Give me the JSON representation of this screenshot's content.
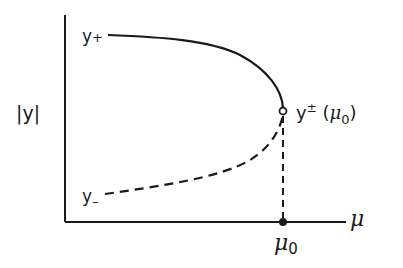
{
  "diagram": {
    "type": "bifurcation-diagram",
    "axes": {
      "y_label": "|y|",
      "x_label": "μ",
      "x_tick_label_symbol": "μ",
      "x_tick_label_subscript": "0"
    },
    "branches": {
      "upper": {
        "symbol": "y",
        "subscript": "+",
        "style": "solid"
      },
      "lower": {
        "symbol": "y",
        "subscript": "–",
        "style": "dashed"
      }
    },
    "turning_point": {
      "symbol": "y",
      "superscript": "±",
      "open_paren": "(",
      "arg_symbol": "μ",
      "arg_subscript": "0",
      "close_paren": ")",
      "marker": "open-circle"
    },
    "axis_point": {
      "marker": "filled-circle"
    },
    "colors": {
      "ink": "#1a1a1a",
      "background": "#ffffff"
    }
  }
}
